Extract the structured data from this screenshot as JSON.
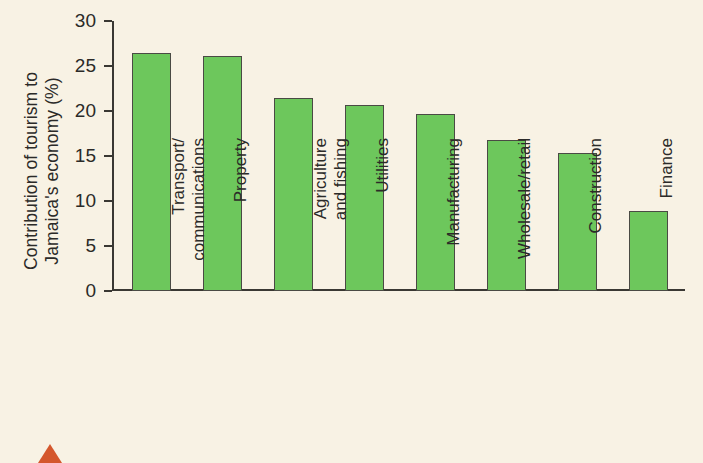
{
  "chart_data": {
    "type": "bar",
    "title": "",
    "xlabel": "",
    "ylabel": "Contribution of tourism to Jamaica's economy (%)",
    "ylabel_line1": "Contribution of tourism to",
    "ylabel_line2": "Jamaica's economy (%)",
    "ylim": [
      0,
      30
    ],
    "yticks": [
      0,
      5,
      10,
      15,
      20,
      25,
      30
    ],
    "ytick_labels": [
      "0",
      "5",
      "10",
      "15",
      "20",
      "25",
      "30"
    ],
    "grid": false,
    "legend": "none",
    "bar_color": "#6dc75c",
    "bar_edge_color": "#4a4a44",
    "background_color": "#f8f2e4",
    "categories": [
      "Transport/communications",
      "Property",
      "Agriculture and fishing",
      "Utilities",
      "Manufacturing",
      "Wholesale/retail",
      "Construction",
      "Finance"
    ],
    "category_lines": [
      [
        "Transport/",
        "communications"
      ],
      [
        "Property"
      ],
      [
        "Agriculture",
        "and fishing"
      ],
      [
        "Utilities"
      ],
      [
        "Manufacturing"
      ],
      [
        "Wholesale/retail"
      ],
      [
        "Construction"
      ],
      [
        "Finance"
      ]
    ],
    "values": [
      26.5,
      26.1,
      21.5,
      20.7,
      19.7,
      16.8,
      15.3,
      8.9
    ]
  },
  "marker": {
    "name": "orange-triangle",
    "color": "#d4572c"
  }
}
